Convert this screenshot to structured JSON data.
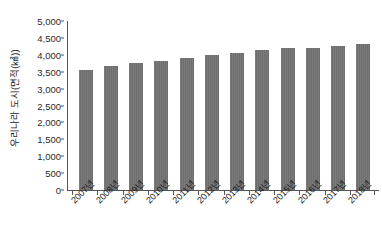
{
  "chart_data": {
    "type": "bar",
    "title": "",
    "subtitle": "",
    "xlabel": "",
    "ylabel": "우리나라 도시(면적(㎢))",
    "categories": [
      "2007년",
      "2008년",
      "2009년",
      "2010년",
      "2011년",
      "2012년",
      "2013년",
      "2014년",
      "2015년",
      "2016년",
      "2017년",
      "2018년"
    ],
    "values": [
      3550,
      3660,
      3760,
      3820,
      3900,
      3990,
      4050,
      4140,
      4210,
      4210,
      4270,
      4330
    ],
    "series": [
      {
        "name": "우리나라 도시(면적(㎢))",
        "values": [
          3550,
          3660,
          3760,
          3820,
          3900,
          3990,
          4050,
          4140,
          4210,
          4210,
          4270,
          4330
        ]
      }
    ],
    "ylim": [
      0,
      5000
    ],
    "y_ticks": [
      0,
      500,
      1000,
      1500,
      2000,
      2500,
      3000,
      3500,
      4000,
      4500,
      5000
    ],
    "y_tick_labels": [
      "0",
      "500",
      "1,000",
      "1,500",
      "2,000",
      "2,500",
      "3,000",
      "3,500",
      "4,000",
      "4,500",
      "5,000"
    ],
    "grid": false,
    "legend": false,
    "legend_position": "none",
    "bar_color": "#6e6e6e",
    "axis_color": "#555555",
    "background_color": "#ffffff",
    "text_color": "#1c1c1c"
  }
}
